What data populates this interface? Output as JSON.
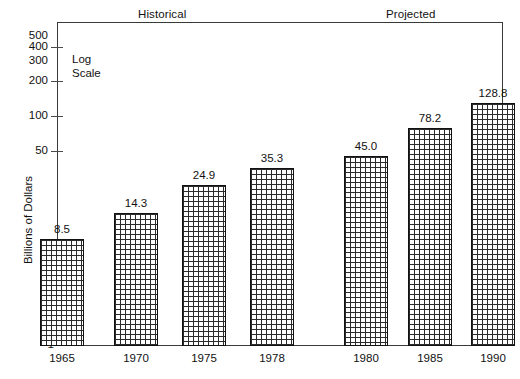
{
  "chart_data": {
    "type": "bar",
    "title": "",
    "xlabel": "",
    "ylabel": "Billions of Dollars",
    "scale_note_line1": "Log",
    "scale_note_line2": "Scale",
    "y_scale": "log",
    "ylim": [
      1,
      656
    ],
    "grid": false,
    "legend": "none",
    "y_ticks": [
      {
        "label": "500",
        "value": 500,
        "has_mark": false
      },
      {
        "label": "400",
        "value": 400,
        "has_mark": true
      },
      {
        "label": "300",
        "value": 300,
        "has_mark": false
      },
      {
        "label": "200",
        "value": 200,
        "has_mark": true
      },
      {
        "label": "100",
        "value": 100,
        "has_mark": true
      },
      {
        "label": "50",
        "value": 50,
        "has_mark": true
      }
    ],
    "y_baseline_label": "1",
    "categories": [
      "1965",
      "1970",
      "1975",
      "1978",
      "1980",
      "1985",
      "1990"
    ],
    "values": [
      8.5,
      14.3,
      24.9,
      35.3,
      45.0,
      78.2,
      128.8
    ],
    "value_labels": [
      "8.5",
      "14.3",
      "24.9",
      "35.3",
      "45.0",
      "78.2",
      "128.8"
    ],
    "groups": [
      {
        "name": "Historical",
        "categories": [
          "1965",
          "1970",
          "1975",
          "1978"
        ]
      },
      {
        "name": "Projected",
        "categories": [
          "1980",
          "1985",
          "1990"
        ]
      }
    ],
    "bar_fill": "cross-hatch-grid",
    "bar_edge_color": "#111111"
  },
  "annotations": {
    "historical_label": "Historical",
    "projected_label": "Projected",
    "corner_mark": ""
  }
}
